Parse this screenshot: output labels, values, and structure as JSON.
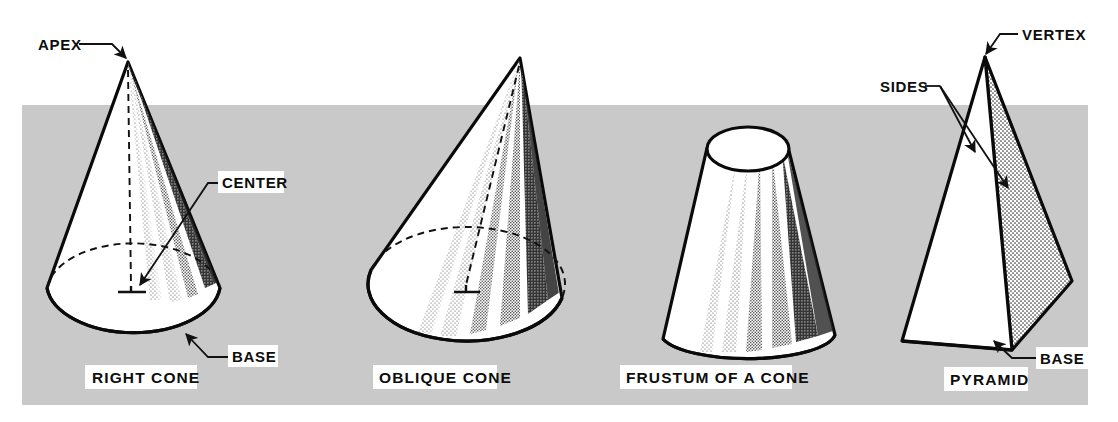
{
  "plate": {
    "background_color": "#ffffff",
    "band_color": "#c9c9c9",
    "ink_color": "#0a0a0a",
    "label_box_color": "#ffffff"
  },
  "figures": [
    {
      "id": "right-cone",
      "caption": "RIGHT CONE",
      "callouts": [
        {
          "id": "apex",
          "text": "APEX",
          "boxed": false
        },
        {
          "id": "center",
          "text": "CENTER",
          "boxed": true
        },
        {
          "id": "base",
          "text": "BASE",
          "boxed": true
        }
      ]
    },
    {
      "id": "oblique-cone",
      "caption": "OBLIQUE CONE",
      "callouts": []
    },
    {
      "id": "frustum",
      "caption": "FRUSTUM OF A CONE",
      "callouts": []
    },
    {
      "id": "pyramid",
      "caption": "PYRAMID",
      "callouts": [
        {
          "id": "vertex",
          "text": "VERTEX",
          "boxed": false
        },
        {
          "id": "sides",
          "text": "SIDES",
          "boxed": false
        },
        {
          "id": "base",
          "text": "BASE",
          "boxed": true
        }
      ]
    }
  ],
  "labels": {
    "apex": "APEX",
    "center": "CENTER",
    "base_cone": "BASE",
    "caption_right_cone": "RIGHT CONE",
    "caption_oblique_cone": "OBLIQUE CONE",
    "caption_frustum": "FRUSTUM OF A CONE",
    "vertex": "VERTEX",
    "sides": "SIDES",
    "base_pyramid": "BASE",
    "caption_pyramid": "PYRAMID"
  }
}
